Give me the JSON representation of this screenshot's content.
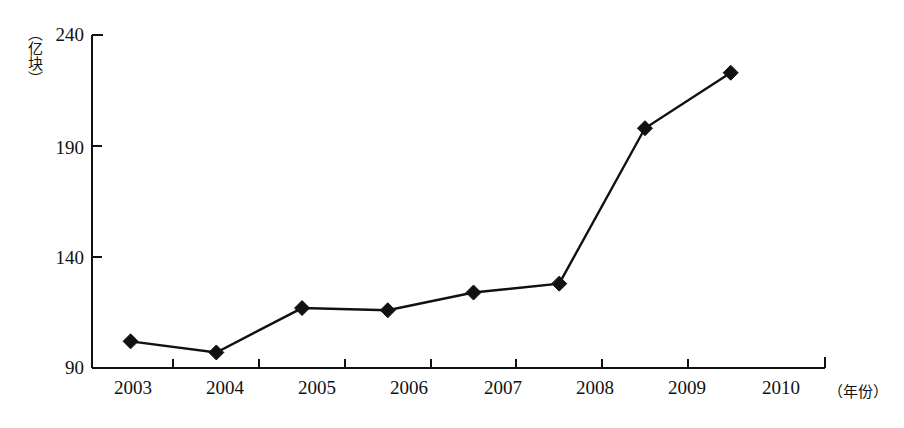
{
  "chart_data": {
    "type": "line",
    "title": "",
    "subtitle": "",
    "xlabel": "（年份）",
    "ylabel": "（亿块）",
    "categories": [
      "2003",
      "2004",
      "2005",
      "2006",
      "2007",
      "2008",
      "2009",
      "2010"
    ],
    "values": [
      102,
      97,
      117,
      116,
      124,
      128,
      198,
      223
    ],
    "series": [
      {
        "name": "",
        "values": [
          102,
          97,
          117,
          116,
          124,
          128,
          198,
          223
        ]
      }
    ],
    "ylim": [
      90,
      240
    ],
    "yticks": [
      90,
      140,
      190,
      240
    ],
    "ytick_labels": [
      "90",
      "140",
      "190",
      "240"
    ],
    "xtick_labels": [
      "2003",
      "2004",
      "2005",
      "2006",
      "2007",
      "2008",
      "2009",
      "2010"
    ],
    "grid": false,
    "legend": null,
    "legend_position": "none",
    "marker": "diamond",
    "line_color": "#111111",
    "marker_color": "#111111",
    "axis_color": "#111111",
    "background_color": "#ffffff",
    "annotations": []
  },
  "axes": {
    "y_unit_label": "（亿块）",
    "x_unit_label": "（年份）"
  }
}
